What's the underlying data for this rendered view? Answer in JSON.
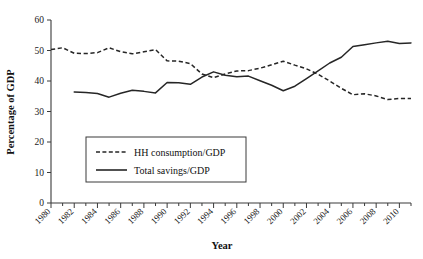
{
  "chart_data": {
    "type": "line",
    "title": "",
    "xlabel": "Year",
    "ylabel": "Percentage of GDP",
    "xlim": [
      1980,
      2011
    ],
    "ylim": [
      0,
      60
    ],
    "yticks": [
      0,
      10,
      20,
      30,
      40,
      50,
      60
    ],
    "xticks": [
      1980,
      1982,
      1984,
      1986,
      1988,
      1990,
      1992,
      1994,
      1996,
      1998,
      2000,
      2002,
      2004,
      2006,
      2008,
      2010
    ],
    "xtick_labels": [
      "1980",
      "1982",
      "1984",
      "1986",
      "1988",
      "1990",
      "1992",
      "1994",
      "1996",
      "1998",
      "2000",
      "2002",
      "2004",
      "2006",
      "2008",
      "2010"
    ],
    "ytick_labels": [
      "0",
      "10",
      "20",
      "30",
      "40",
      "50",
      "60"
    ],
    "grid": false,
    "legend_position": "center-left",
    "x": [
      1980,
      1981,
      1982,
      1983,
      1984,
      1985,
      1986,
      1987,
      1988,
      1989,
      1990,
      1991,
      1992,
      1993,
      1994,
      1995,
      1996,
      1997,
      1998,
      1999,
      2000,
      2001,
      2002,
      2003,
      2004,
      2005,
      2006,
      2007,
      2008,
      2009,
      2010,
      2011
    ],
    "series": [
      {
        "name": "HH consumption/GDP",
        "style": "dashed",
        "color": "#262626",
        "x": [
          1980,
          1981,
          1982,
          1983,
          1984,
          1985,
          1986,
          1987,
          1988,
          1989,
          1990,
          1991,
          1992,
          1993,
          1994,
          1995,
          1996,
          1997,
          1998,
          1999,
          2000,
          2001,
          2002,
          2003,
          2004,
          2005,
          2006,
          2007,
          2008,
          2009,
          2010,
          2011
        ],
        "values": [
          50.3,
          50.9,
          49.1,
          49.0,
          49.3,
          50.9,
          49.6,
          48.9,
          49.6,
          50.3,
          46.6,
          46.5,
          45.7,
          42.3,
          41.1,
          42.3,
          43.3,
          43.4,
          44.2,
          45.3,
          46.5,
          45.2,
          44.0,
          42.2,
          40.0,
          37.6,
          35.5,
          35.8,
          35.1,
          33.9,
          34.3,
          34.3
        ]
      },
      {
        "name": "Total savings/GDP",
        "style": "solid",
        "color": "#262626",
        "x": [
          1982,
          1983,
          1984,
          1985,
          1986,
          1987,
          1988,
          1989,
          1990,
          1991,
          1992,
          1993,
          1994,
          1995,
          1996,
          1997,
          1998,
          1999,
          2000,
          2001,
          2002,
          2003,
          2004,
          2005,
          2006,
          2007,
          2008,
          2009,
          2010,
          2011
        ],
        "values": [
          36.4,
          36.2,
          35.9,
          34.7,
          36.0,
          37.0,
          36.6,
          36.1,
          39.5,
          39.4,
          38.9,
          41.3,
          43.0,
          41.9,
          41.4,
          41.6,
          40.1,
          38.6,
          36.8,
          38.3,
          40.8,
          43.3,
          45.9,
          47.8,
          51.3,
          51.9,
          52.5,
          53.0,
          52.3,
          52.5
        ]
      }
    ],
    "legend_entries": [
      {
        "label": "HH consumption/GDP",
        "style": "dashed"
      },
      {
        "label": "Total savings/GDP",
        "style": "solid"
      }
    ]
  }
}
